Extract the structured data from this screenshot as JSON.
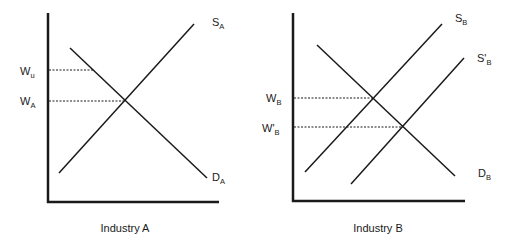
{
  "panels": [
    {
      "caption": "Industry A",
      "curves": {
        "supply": {
          "main": "S",
          "sub": "A"
        },
        "demand": {
          "main": "D",
          "sub": "A"
        }
      },
      "wage_labels": [
        {
          "main": "W",
          "sub": "u"
        },
        {
          "main": "W",
          "sub": "A"
        }
      ]
    },
    {
      "caption": "Industry B",
      "curves": {
        "supply": {
          "main": "S",
          "sub": "B"
        },
        "supply_shifted": {
          "main": "S'",
          "sub": "B"
        },
        "demand": {
          "main": "D",
          "sub": "B"
        }
      },
      "wage_labels": [
        {
          "main": "W",
          "sub": "B"
        },
        {
          "main": "W'",
          "sub": "B"
        }
      ]
    }
  ],
  "colors": {
    "line": "#1a1a1a",
    "background": "#ffffff"
  }
}
